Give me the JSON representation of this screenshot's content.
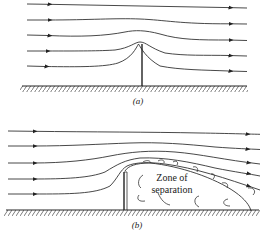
{
  "figure": {
    "panel_a": {
      "label": "(a)",
      "description": "Streamlines over a thin fence; flow follows the obstacle",
      "streamline_count": 5
    },
    "panel_b": {
      "label": "(b)",
      "description": "Streamlines over a fence with flow separation behind it",
      "streamline_count": 5,
      "annotation_line1": "Zone of",
      "annotation_line2": "separation"
    }
  },
  "colors": {
    "line": "#333333",
    "background": "#ffffff"
  }
}
